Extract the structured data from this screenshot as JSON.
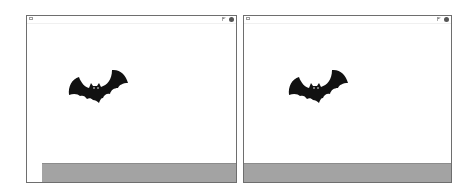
{
  "stages": [
    {
      "id": "left",
      "sprite": "bat",
      "icons": {
        "fullscreen": "fullscreen-icon",
        "green_flag": "green-flag-icon",
        "stop": "stop-icon"
      },
      "ground_color": "#a3a3a3"
    },
    {
      "id": "right",
      "sprite": "bat",
      "icons": {
        "fullscreen": "fullscreen-icon",
        "green_flag": "green-flag-icon",
        "stop": "stop-icon"
      },
      "ground_color": "#a3a3a3"
    }
  ],
  "colors": {
    "border": "#6e6e6e",
    "ground": "#a3a3a3",
    "sprite": "#111111",
    "background": "#ffffff"
  }
}
